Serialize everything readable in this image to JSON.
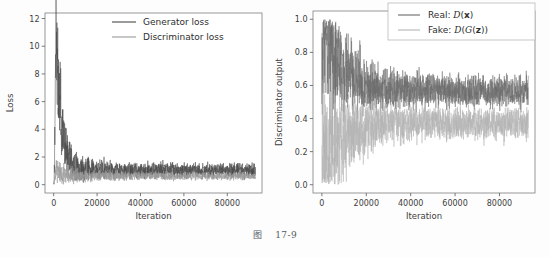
{
  "figure": {
    "caption_label": "图",
    "caption_number": "17-9"
  },
  "chart_data": [
    {
      "id": "gan-loss",
      "type": "line",
      "title": "",
      "xlabel": "Iteration",
      "ylabel": "Loss",
      "xlim": [
        -4000,
        96000
      ],
      "ylim": [
        -0.6,
        12.4
      ],
      "xticks": [
        0,
        20000,
        40000,
        60000,
        80000
      ],
      "xticklabels": [
        "0",
        "20000",
        "40000",
        "60000",
        "80000"
      ],
      "yticks": [
        0,
        2,
        4,
        6,
        8,
        10,
        12
      ],
      "yticklabels": [
        "0",
        "2",
        "4",
        "6",
        "8",
        "10",
        "12"
      ],
      "grid": false,
      "legend_position": "upper right",
      "series": [
        {
          "name": "Generator loss",
          "color": "#4a4a4a",
          "peak_value": 11.8,
          "peak_iteration": 900,
          "steady_mean": 1.05,
          "steady_band": [
            0.62,
            1.45
          ]
        },
        {
          "name": "Discriminator loss",
          "color": "#9a9a9a",
          "peak_value": 1.3,
          "peak_iteration": 1200,
          "steady_mean": 0.62,
          "steady_band": [
            0.42,
            0.85
          ]
        }
      ]
    },
    {
      "id": "discriminator-output",
      "type": "line",
      "title": "",
      "xlabel": "Iteration",
      "ylabel": "Discriminator output",
      "xlim": [
        -4000,
        96000
      ],
      "ylim": [
        -0.05,
        1.05
      ],
      "xticks": [
        0,
        20000,
        40000,
        60000,
        80000
      ],
      "xticklabels": [
        "0",
        "20000",
        "40000",
        "60000",
        "80000"
      ],
      "yticks": [
        0.0,
        0.2,
        0.4,
        0.6,
        0.8,
        1.0
      ],
      "yticklabels": [
        "0.0",
        "0.2",
        "0.4",
        "0.6",
        "0.8",
        "1.0"
      ],
      "grid": false,
      "legend_position": "upper right",
      "series": [
        {
          "name": "Real: D(x)",
          "label_parts": [
            "Real: ",
            "D",
            "(",
            "x",
            ")"
          ],
          "color": "#6b6b6b",
          "start_value": 1.0,
          "steady_mean": 0.565,
          "steady_band": [
            0.45,
            0.68
          ]
        },
        {
          "name": "Fake: D(G(z))",
          "label_parts": [
            "Fake: ",
            "D",
            "(",
            "G",
            "(",
            "z",
            "))"
          ],
          "color": "#b4b4b4",
          "start_value": 0.0,
          "steady_mean": 0.37,
          "steady_band": [
            0.28,
            0.46
          ]
        }
      ]
    }
  ],
  "axes": {
    "frame_color": "#8d8d8d",
    "tick_color": "#6a6a6a",
    "text_color": "#3d3d3d"
  }
}
